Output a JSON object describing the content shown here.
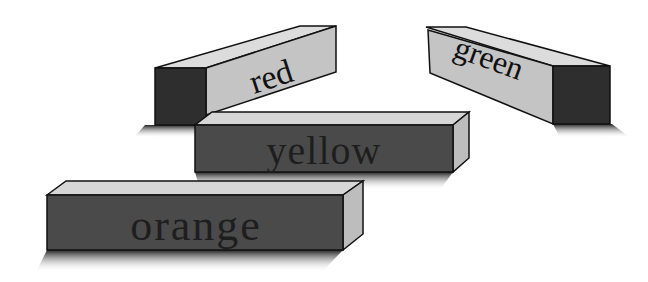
{
  "diagram": {
    "type": "3d-block-labels",
    "blocks": [
      {
        "id": "red",
        "label": "red",
        "orientation": "receding-right",
        "front_face_color": "#c4c4c4",
        "end_face_color": "#2e2e2e"
      },
      {
        "id": "green",
        "label": "green",
        "orientation": "receding-left",
        "front_face_color": "#c4c4c4",
        "end_face_color": "#2e2e2e"
      },
      {
        "id": "yellow",
        "label": "yellow",
        "orientation": "frontal",
        "front_face_color": "#4a4a4a",
        "end_face_color": "#bdbdbd"
      },
      {
        "id": "orange",
        "label": "orange",
        "orientation": "frontal",
        "front_face_color": "#4a4a4a",
        "end_face_color": "#bdbdbd"
      }
    ],
    "colors": {
      "background": "#ffffff",
      "top_face": "#d6d6d6",
      "outline": "#111111",
      "shadow": "#555555"
    }
  }
}
